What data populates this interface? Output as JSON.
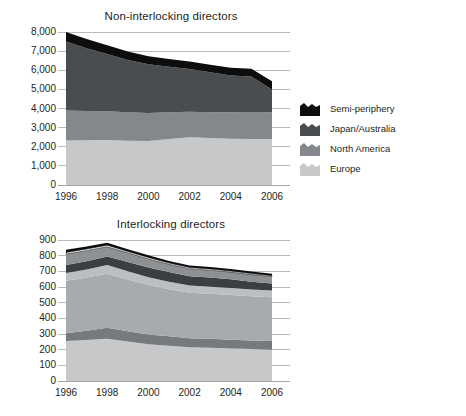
{
  "figure": {
    "background": "#ffffff",
    "text_color": "#231f20"
  },
  "charts": [
    {
      "id": "non-interlocking",
      "title": "Non-interlocking directors"
    },
    {
      "id": "interlocking",
      "title": "Interlocking directors"
    }
  ],
  "chart_data": [
    {
      "type": "area",
      "stacked": true,
      "title": "Non-interlocking directors",
      "xlabel": "",
      "ylabel": "",
      "x": [
        1996,
        1997,
        1998,
        1999,
        2000,
        2001,
        2002,
        2003,
        2004,
        2005,
        2006
      ],
      "xticks": [
        "1996",
        "1998",
        "2000",
        "2002",
        "2004",
        "2006"
      ],
      "xtick_values": [
        1996,
        1998,
        2000,
        2002,
        2004,
        2006
      ],
      "yticks": [
        "0",
        "1,000",
        "2,000",
        "3,000",
        "4,000",
        "5,000",
        "6,000",
        "7,000",
        "8,000"
      ],
      "ytick_values": [
        0,
        1000,
        2000,
        3000,
        4000,
        5000,
        6000,
        7000,
        8000
      ],
      "ylim": [
        0,
        8000
      ],
      "grid": true,
      "legend_position": "right",
      "series": [
        {
          "name": "Europe",
          "color": "#c6c8ca",
          "values": [
            2330,
            2340,
            2350,
            2320,
            2300,
            2400,
            2500,
            2460,
            2420,
            2400,
            2400
          ]
        },
        {
          "name": "North America",
          "color": "#84878b",
          "values": [
            1570,
            1530,
            1500,
            1480,
            1470,
            1400,
            1330,
            1350,
            1380,
            1390,
            1400
          ]
        },
        {
          "name": "Japan/Australia",
          "color": "#4a4d50",
          "values": [
            3600,
            3280,
            3000,
            2740,
            2540,
            2380,
            2230,
            2080,
            1930,
            1880,
            1200
          ]
        },
        {
          "name": "Semi-periphery",
          "color": "#0d0d0d",
          "values": [
            500,
            480,
            460,
            440,
            420,
            410,
            400,
            400,
            400,
            410,
            420
          ]
        }
      ],
      "totals": [
        8000,
        7630,
        7310,
        6980,
        6730,
        6590,
        6460,
        6290,
        6130,
        6080,
        5420
      ]
    },
    {
      "type": "area",
      "stacked": true,
      "title": "Interlocking directors",
      "xlabel": "",
      "ylabel": "",
      "x": [
        1996,
        1997,
        1998,
        1999,
        2000,
        2001,
        2002,
        2003,
        2004,
        2005,
        2006
      ],
      "xticks": [
        "1996",
        "1998",
        "2000",
        "2002",
        "2004",
        "2006"
      ],
      "xtick_values": [
        1996,
        1998,
        2000,
        2002,
        2004,
        2006
      ],
      "yticks": [
        "0",
        "100",
        "200",
        "300",
        "400",
        "500",
        "600",
        "700",
        "800",
        "900"
      ],
      "ytick_values": [
        0,
        100,
        200,
        300,
        400,
        500,
        600,
        700,
        800,
        900
      ],
      "ylim": [
        0,
        900
      ],
      "grid": true,
      "legend_position": "right",
      "series": [
        {
          "name": "Europe, national",
          "color": "#c6c8ca",
          "values": [
            255,
            262,
            270,
            252,
            235,
            225,
            215,
            212,
            208,
            204,
            200
          ]
        },
        {
          "name": "Europe, transnational",
          "color": "#76797d",
          "values": [
            50,
            58,
            70,
            66,
            62,
            60,
            58,
            57,
            56,
            55,
            55
          ]
        },
        {
          "name": "North America, national",
          "color": "#a8abae",
          "values": [
            335,
            340,
            345,
            330,
            315,
            300,
            290,
            288,
            285,
            282,
            280
          ]
        },
        {
          "name": "North America, transnational",
          "color": "#bcbfc2",
          "values": [
            50,
            52,
            55,
            52,
            50,
            48,
            46,
            45,
            44,
            43,
            42
          ]
        },
        {
          "name": "Europe–North America",
          "color": "#3c3f42",
          "values": [
            50,
            52,
            55,
            60,
            63,
            62,
            60,
            58,
            56,
            50,
            45
          ]
        },
        {
          "name": "Japan/Australia",
          "color": "#8e9194",
          "values": [
            70,
            68,
            62,
            58,
            54,
            50,
            48,
            47,
            46,
            45,
            44
          ]
        },
        {
          "name": "Atlantic–Japan/Australia",
          "color": "#ffffff",
          "values": [
            10,
            10,
            10,
            9,
            9,
            8,
            8,
            8,
            7,
            7,
            6
          ]
        },
        {
          "name": "Semi-periphery",
          "color": "#0d0d0d",
          "values": [
            18,
            16,
            15,
            14,
            14,
            13,
            13,
            13,
            13,
            13,
            13
          ]
        }
      ],
      "totals": [
        838,
        858,
        882,
        841,
        802,
        766,
        738,
        728,
        715,
        699,
        681
      ]
    }
  ],
  "legends": {
    "top": [
      {
        "label": "Semi-periphery",
        "color": "#0d0d0d",
        "border": "none"
      },
      {
        "label": "Japan/Australia",
        "color": "#4a4d50",
        "border": "none"
      },
      {
        "label": "North America",
        "color": "#84878b",
        "border": "none"
      },
      {
        "label": "Europe",
        "color": "#c6c8ca",
        "border": "none"
      }
    ],
    "bottom": [
      {
        "label": "Semi-periphery",
        "color": "#0d0d0d",
        "border": "none"
      },
      {
        "label": "Atlantic–Japan/Australia",
        "color": "#ffffff",
        "border": "#231f20"
      },
      {
        "label": "Japan/Australia",
        "color": "#8e9194",
        "border": "none"
      },
      {
        "label": "Europe–North America",
        "color": "#3c3f42",
        "border": "none"
      },
      {
        "label": "North America, transnational",
        "color": "#bcbfc2",
        "border": "none"
      },
      {
        "label": "North America, national",
        "color": "#a8abae",
        "border": "none"
      },
      {
        "label": "Europe, transnational",
        "color": "#76797d",
        "border": "none"
      },
      {
        "label": "Europe, national",
        "color": "#c6c8ca",
        "border": "none"
      }
    ]
  }
}
